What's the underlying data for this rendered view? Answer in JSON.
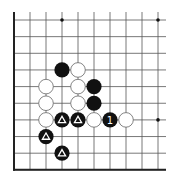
{
  "diagram": {
    "type": "go-board-fragment",
    "grid": {
      "columns": 10,
      "rows": 10,
      "origin_x": 14,
      "origin_y": 20,
      "spacing_x": 16.0,
      "spacing_y": 16.65,
      "right_extension": 8,
      "edges": [
        "left",
        "bottom"
      ],
      "line_color": "#555555",
      "edge_color": "#222222"
    },
    "star_points": [
      {
        "col": 3,
        "row": 0
      },
      {
        "col": 9,
        "row": 0
      },
      {
        "col": 9,
        "row": 6
      }
    ],
    "stones": [
      {
        "col": 3,
        "row": 3,
        "color": "black",
        "mark": ""
      },
      {
        "col": 4,
        "row": 3,
        "color": "white",
        "mark": ""
      },
      {
        "col": 2,
        "row": 4,
        "color": "white",
        "mark": ""
      },
      {
        "col": 4,
        "row": 4,
        "color": "white",
        "mark": ""
      },
      {
        "col": 5,
        "row": 4,
        "color": "black",
        "mark": ""
      },
      {
        "col": 2,
        "row": 5,
        "color": "white",
        "mark": ""
      },
      {
        "col": 4,
        "row": 5,
        "color": "white",
        "mark": ""
      },
      {
        "col": 5,
        "row": 5,
        "color": "black",
        "mark": ""
      },
      {
        "col": 2,
        "row": 6,
        "color": "white",
        "mark": ""
      },
      {
        "col": 3,
        "row": 6,
        "color": "black",
        "mark": "triangle"
      },
      {
        "col": 4,
        "row": 6,
        "color": "black",
        "mark": "triangle"
      },
      {
        "col": 5,
        "row": 6,
        "color": "white",
        "mark": ""
      },
      {
        "col": 6,
        "row": 6,
        "color": "black",
        "mark": "1"
      },
      {
        "col": 7,
        "row": 6,
        "color": "white",
        "mark": ""
      },
      {
        "col": 2,
        "row": 7,
        "color": "black",
        "mark": "triangle"
      },
      {
        "col": 3,
        "row": 8,
        "color": "black",
        "mark": "triangle"
      }
    ],
    "colors": {
      "black_stone": "#111111",
      "white_stone": "#ffffff",
      "white_stone_outline": "#666666",
      "mark_on_black": "#ffffff",
      "star": "#111111"
    }
  }
}
